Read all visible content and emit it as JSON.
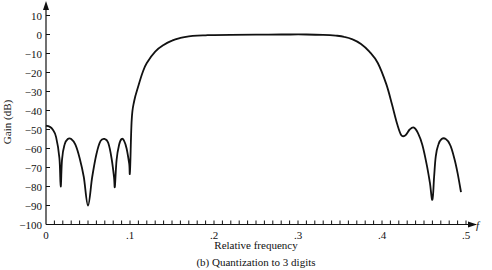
{
  "chart_data": {
    "type": "line",
    "title": "",
    "caption": "(b)  Quantization to 3 digits",
    "xlabel": "Relative frequency",
    "ylabel": "Gain (dB)",
    "x_axis_symbol": "f",
    "xlim": [
      0,
      0.5
    ],
    "ylim": [
      -100,
      10
    ],
    "grid": false,
    "legend": null,
    "x_ticks": [
      0,
      0.1,
      0.2,
      0.3,
      0.4,
      0.5
    ],
    "x_tick_labels": [
      "0",
      ".1",
      ".2",
      ".3",
      ".4",
      ".5"
    ],
    "x_minor_tick_step": 0.01,
    "y_ticks": [
      10,
      0,
      -10,
      -20,
      -30,
      -40,
      -50,
      -60,
      -70,
      -80,
      -90,
      -100
    ],
    "y_tick_labels": [
      "10",
      "0",
      "−10",
      "−20",
      "−30",
      "−40",
      "−50",
      "−60",
      "−70",
      "−80",
      "−90",
      "−100"
    ],
    "series": [
      {
        "name": "Gain",
        "x": [
          0,
          0.004,
          0.008,
          0.012,
          0.016,
          0.0175,
          0.019,
          0.022,
          0.026,
          0.03,
          0.035,
          0.04,
          0.045,
          0.05,
          0.055,
          0.06,
          0.065,
          0.07,
          0.074,
          0.078,
          0.081,
          0.082,
          0.084,
          0.087,
          0.09,
          0.093,
          0.096,
          0.099,
          0.1,
          0.102,
          0.105,
          0.11,
          0.115,
          0.12,
          0.13,
          0.14,
          0.15,
          0.16,
          0.17,
          0.18,
          0.19,
          0.2,
          0.22,
          0.25,
          0.28,
          0.31,
          0.33,
          0.345,
          0.355,
          0.365,
          0.375,
          0.385,
          0.395,
          0.405,
          0.412,
          0.418,
          0.423,
          0.428,
          0.433,
          0.438,
          0.443,
          0.448,
          0.453,
          0.457,
          0.46,
          0.462,
          0.464,
          0.467,
          0.471,
          0.476,
          0.481,
          0.486,
          0.49,
          0.494
        ],
        "y": [
          -48,
          -48.5,
          -50,
          -54,
          -65,
          -80,
          -66,
          -58,
          -55,
          -55,
          -58,
          -65,
          -75,
          -90,
          -75,
          -63,
          -56,
          -55,
          -57,
          -65,
          -75,
          -80,
          -66,
          -58,
          -55,
          -56,
          -60,
          -68,
          -72,
          -45,
          -35,
          -27,
          -20,
          -15,
          -9,
          -5.5,
          -3.2,
          -1.8,
          -1,
          -0.6,
          -0.4,
          -0.3,
          -0.2,
          -0.1,
          0,
          0,
          -0.2,
          -0.6,
          -1.2,
          -2.5,
          -5,
          -9,
          -15,
          -26,
          -37,
          -47,
          -53,
          -53,
          -50,
          -49,
          -52,
          -58,
          -68,
          -78,
          -87,
          -75,
          -64,
          -58,
          -55,
          -55,
          -58,
          -65,
          -73,
          -83
        ]
      }
    ]
  }
}
